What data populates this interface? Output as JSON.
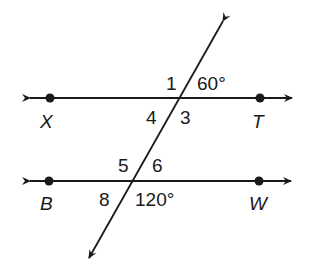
{
  "diagram": {
    "type": "parallel lines cut by transversal",
    "lines": [
      {
        "name": "line-XT",
        "points": [
          "X",
          "T"
        ]
      },
      {
        "name": "line-BW",
        "points": [
          "B",
          "W"
        ]
      }
    ],
    "points": {
      "X": "X",
      "T": "T",
      "B": "B",
      "W": "W"
    },
    "angles": {
      "a1": "1",
      "a60": "60°",
      "a4": "4",
      "a3": "3",
      "a5": "5",
      "a6": "6",
      "a8": "8",
      "a120": "120°"
    }
  }
}
